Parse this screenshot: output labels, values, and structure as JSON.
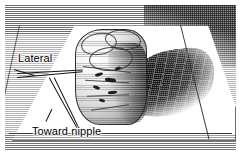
{
  "figure": {
    "medium": "grayscale line-engraving / halftone medical illustration",
    "background_color": "#ffffff",
    "ink_color": "#000000",
    "shadow_color": "#6d6d6d"
  },
  "labels": {
    "lateral": "Lateral",
    "toward_nipple": "Toward nipple"
  },
  "scene": {
    "drape_name": "sterile-drape",
    "specimen_name": "breast-tissue-specimen",
    "shadow_name": "cast-shadow",
    "suture_lateral_name": "marking-suture-lateral",
    "suture_nipple_name": "marking-suture-toward-nipple"
  }
}
